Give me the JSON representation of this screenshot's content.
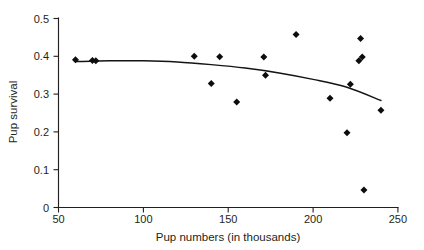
{
  "figure": {
    "background_color": "#ffffff",
    "foreground_color": "#231f20",
    "marker_color": "#0d0d0d",
    "curve_color": "#141414"
  },
  "axes": {
    "x_title": "Pup numbers (in thousands)",
    "y_title": "Pup survival",
    "x_ticks": [
      "50",
      "100",
      "150",
      "200",
      "250"
    ],
    "y_ticks": [
      "0",
      "0.1",
      "0.2",
      "0.3",
      "0.4",
      "0.5"
    ]
  },
  "chart_data": {
    "type": "scatter",
    "title": "",
    "xlabel": "Pup numbers (in thousands)",
    "ylabel": "Pup survival",
    "xlim": [
      50,
      250
    ],
    "ylim": [
      0,
      0.5
    ],
    "xticks": [
      50,
      100,
      150,
      200,
      250
    ],
    "yticks": [
      0,
      0.1,
      0.2,
      0.3,
      0.4,
      0.5
    ],
    "grid": false,
    "legend": null,
    "marker": "diamond",
    "series": [
      {
        "name": "Pup survival observations",
        "type": "scatter",
        "points": [
          {
            "x": 60,
            "y": 0.391
          },
          {
            "x": 70,
            "y": 0.389
          },
          {
            "x": 72,
            "y": 0.388
          },
          {
            "x": 130,
            "y": 0.4
          },
          {
            "x": 140,
            "y": 0.328
          },
          {
            "x": 145,
            "y": 0.399
          },
          {
            "x": 155,
            "y": 0.279
          },
          {
            "x": 171,
            "y": 0.398
          },
          {
            "x": 172,
            "y": 0.35
          },
          {
            "x": 190,
            "y": 0.458
          },
          {
            "x": 210,
            "y": 0.289
          },
          {
            "x": 220,
            "y": 0.198
          },
          {
            "x": 222,
            "y": 0.326
          },
          {
            "x": 227,
            "y": 0.388
          },
          {
            "x": 228,
            "y": 0.447
          },
          {
            "x": 229,
            "y": 0.398
          },
          {
            "x": 230,
            "y": 0.046
          },
          {
            "x": 240,
            "y": 0.257
          }
        ]
      },
      {
        "name": "Fitted curve",
        "type": "line",
        "points": [
          {
            "x": 60,
            "y": 0.386
          },
          {
            "x": 80,
            "y": 0.388
          },
          {
            "x": 100,
            "y": 0.388
          },
          {
            "x": 120,
            "y": 0.385
          },
          {
            "x": 140,
            "y": 0.378
          },
          {
            "x": 160,
            "y": 0.369
          },
          {
            "x": 180,
            "y": 0.356
          },
          {
            "x": 200,
            "y": 0.339
          },
          {
            "x": 220,
            "y": 0.318
          },
          {
            "x": 240,
            "y": 0.283
          }
        ]
      }
    ]
  }
}
